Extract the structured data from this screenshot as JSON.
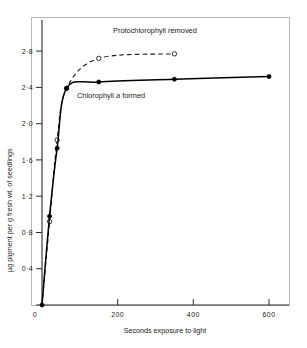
{
  "chart_data": {
    "type": "line",
    "title": "",
    "xlabel": "Seconds exposure to light",
    "ylabel": "µg pigment per g fresh wt. of seedlings",
    "xlim": [
      0,
      660
    ],
    "ylim": [
      0,
      3.0
    ],
    "xticks": [
      0,
      200,
      400,
      600
    ],
    "xticklabels": [
      "0",
      "200",
      "400",
      "600"
    ],
    "yticks": [
      0,
      0.4,
      0.8,
      1.2,
      1.6,
      2.0,
      2.4,
      2.8
    ],
    "yticklabels": [
      "0",
      "0·4",
      "0·8",
      "1·2",
      "1·6",
      "2·0",
      "2·4",
      "2·8"
    ],
    "grid": false,
    "legend_position": "inline-annotations",
    "series": [
      {
        "name": "Chlorophyll a formed",
        "linestyle": "solid",
        "marker": "filled-circle",
        "color": "#000000",
        "x": [
          0,
          20,
          40,
          65,
          150,
          350,
          600
        ],
        "y": [
          0.0,
          0.98,
          1.73,
          2.39,
          2.46,
          2.49,
          2.52
        ]
      },
      {
        "name": "Protochlorophyll removed",
        "linestyle": "dashed",
        "marker": "open-circle",
        "color": "#000000",
        "x": [
          0,
          20,
          40,
          65,
          150,
          350
        ],
        "y": [
          0.0,
          0.92,
          1.82,
          2.39,
          2.72,
          2.77
        ]
      }
    ],
    "annotations": [
      {
        "id": "protochlorophyll-label",
        "text": "Protochlorophyll removed",
        "x": 190,
        "y": 2.93
      },
      {
        "id": "chlorophyll-label",
        "text_before": "Chlorophyll ",
        "text_italic": "a",
        "text_after": " formed",
        "x": 120,
        "y": 2.27
      }
    ]
  },
  "axes": {
    "x_axis_title": "Seconds exposure to light",
    "y_axis_title": "µg pigment per g fresh wt. of seedlings",
    "x_tick_labels": [
      "0",
      "200",
      "400",
      "600"
    ],
    "y_tick_labels": [
      "0·4",
      "0·8",
      "1·2",
      "1·6",
      "2·0",
      "2·4",
      "2·8"
    ],
    "origin_label": "0"
  },
  "annotations": {
    "protochlorophyll": "Protochlorophyll removed",
    "chlorophyll_before": "Chlorophyll ",
    "chlorophyll_italic": "a",
    "chlorophyll_after": " formed"
  },
  "colors": {
    "ink": "#1a1a1a",
    "curve": "#000000",
    "frame": "#b9b9b9",
    "background": "#ffffff"
  }
}
